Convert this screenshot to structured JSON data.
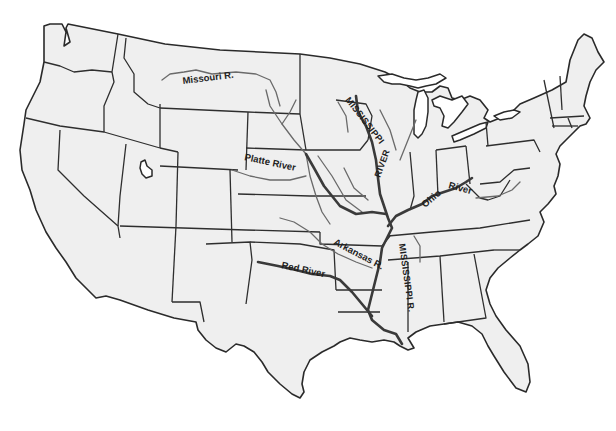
{
  "map": {
    "title": "United States river map",
    "colors": {
      "land": "#efefef",
      "border": "#2e2e2e",
      "river": "#6a6a6a",
      "major_river": "#3a3a3a",
      "background": "#ffffff"
    },
    "labels": {
      "missouri": "Missouri R.",
      "platte": "Platte River",
      "mississippi_upper_1": "MISSISSIPPI",
      "mississippi_upper_2": "RIVER",
      "ohio_1": "Ohio",
      "ohio_2": "River",
      "arkansas": "Arkansas R.",
      "red": "Red River",
      "mississippi_lower": "MISSISSIPPI R."
    }
  }
}
